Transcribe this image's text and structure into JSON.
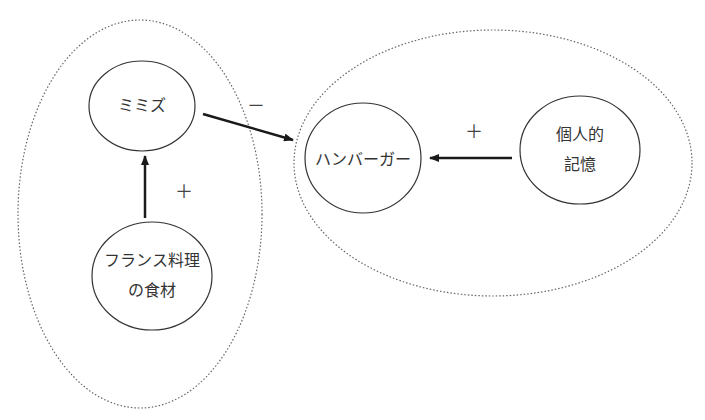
{
  "nodes": {
    "mimizu": {
      "label": "ミミズ"
    },
    "hamburger": {
      "label": "ハンバーガー"
    },
    "memory": {
      "line1": "個人的",
      "line2": "記憶"
    },
    "french": {
      "line1": "フランス料理",
      "line2": "の食材"
    }
  },
  "edges": {
    "mimizu_to_hamburger": {
      "sign": "－",
      "polarity": "negative"
    },
    "memory_to_hamburger": {
      "sign": "＋",
      "polarity": "positive"
    },
    "french_to_mimizu": {
      "sign": "＋",
      "polarity": "positive"
    }
  },
  "groups": [
    "left-group",
    "right-group"
  ],
  "colors": {
    "stroke": "#333333",
    "arrow": "#1a1a1a",
    "dotted": "#666666"
  }
}
